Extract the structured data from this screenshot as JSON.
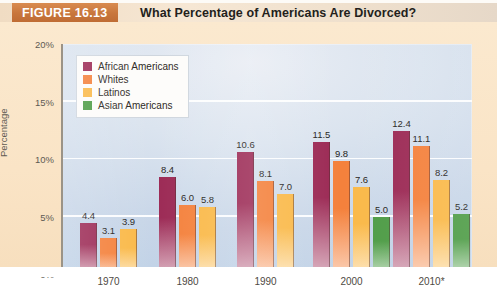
{
  "header": {
    "figure_tag": "FIGURE 16.13",
    "title": "What Percentage of Americans Are Divorced?"
  },
  "colors": {
    "african_americans": "#9c2a55",
    "whites": "#f4813c",
    "latinos": "#f9b githubusercontent",
    "latinos_fix": "#fab949",
    "asian_americans": "#4e9c46",
    "header_orange": "#c8763c",
    "plot_bg": "#c8d6e8",
    "page_bg": "#fae4c6"
  },
  "chart_data": {
    "type": "bar",
    "title": "What Percentage of Americans Are Divorced?",
    "xlabel": "",
    "ylabel": "Percentage",
    "ylim": [
      0,
      20
    ],
    "yticks": [
      0,
      5,
      10,
      15,
      20
    ],
    "ytick_labels": [
      "0%",
      "5%",
      "10%",
      "15%",
      "20%"
    ],
    "grid": true,
    "legend_position": "upper-left",
    "categories": [
      "1970",
      "1980",
      "1990",
      "2000",
      "2010*"
    ],
    "series": [
      {
        "name": "African Americans",
        "color": "#9c2a55",
        "values": [
          4.4,
          8.4,
          10.6,
          11.5,
          12.4
        ]
      },
      {
        "name": "Whites",
        "color": "#f4813c",
        "values": [
          3.1,
          6.0,
          8.1,
          9.8,
          11.1
        ]
      },
      {
        "name": "Latinos",
        "color": "#fab949",
        "values": [
          3.9,
          5.8,
          7.0,
          7.6,
          8.2
        ]
      },
      {
        "name": "Asian Americans",
        "color": "#4e9c46",
        "values": [
          null,
          null,
          null,
          5.0,
          5.2
        ]
      }
    ],
    "value_labels": {
      "1970": [
        "4.4",
        "3.1",
        "3.9"
      ],
      "1980": [
        "8.4",
        "6.0",
        "5.8"
      ],
      "1990": [
        "10.6",
        "8.1",
        "7.0"
      ],
      "2000": [
        "11.5",
        "9.8",
        "7.6",
        "5.0"
      ],
      "2010*": [
        "12.4",
        "11.1",
        "8.2",
        "5.2"
      ]
    }
  }
}
